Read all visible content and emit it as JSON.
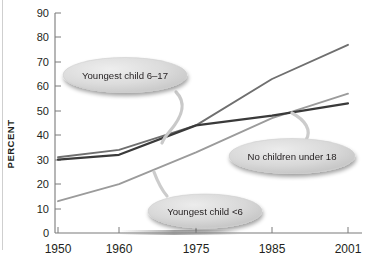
{
  "chart_data": {
    "type": "line",
    "title": "",
    "subtitle": "",
    "xlabel": "",
    "ylabel": "PERCENT",
    "x": [
      1950,
      1960,
      1975,
      1985,
      2001
    ],
    "xtick_labels": [
      "1950",
      "1960",
      "1975",
      "1985",
      "2001"
    ],
    "ytick_labels": [
      "0",
      "10",
      "20",
      "30",
      "40",
      "50",
      "60",
      "70",
      "80",
      "90"
    ],
    "ylim": [
      0,
      90
    ],
    "ytick_step": 10,
    "grid": false,
    "legend_position": "callouts-on-plot",
    "series": [
      {
        "name": "Youngest child 6–17",
        "color": "#6f6f6f",
        "values": [
          31,
          34,
          44,
          63,
          77
        ]
      },
      {
        "name": "No children under 18",
        "color": "#3a3a3a",
        "values": [
          30,
          32,
          44,
          48,
          53
        ]
      },
      {
        "name": "Youngest child <6",
        "color": "#9b9b9b",
        "values": [
          13,
          20,
          33,
          47,
          57
        ]
      }
    ],
    "annotations": [
      {
        "label": "Youngest child 6–17",
        "points_to_series": "Youngest child 6–17"
      },
      {
        "label": "No children under 18",
        "points_to_series": "No children under 18"
      },
      {
        "label": "Youngest child <6",
        "points_to_series": "Youngest child <6"
      }
    ]
  },
  "axis": {
    "y_title": "PERCENT",
    "y_ticks": [
      "90",
      "80",
      "70",
      "60",
      "50",
      "40",
      "30",
      "20",
      "10",
      "0"
    ],
    "x_ticks": [
      "1950",
      "1960",
      "1975",
      "1985",
      "2001"
    ]
  },
  "callouts": {
    "top": "Youngest child 6–17",
    "middle": "No children under 18",
    "bottom": "Youngest child <6"
  },
  "colors": {
    "series_light": "#9b9b9b",
    "series_mid": "#6f6f6f",
    "series_dark": "#3a3a3a",
    "axis": "#808080",
    "callout_fill": "#d9d9d9",
    "background": "#ffffff"
  }
}
